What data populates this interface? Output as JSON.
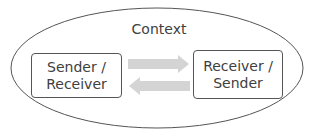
{
  "diagram": {
    "context_label": "Context",
    "left_box": {
      "line1": "Sender /",
      "line2": "Receiver"
    },
    "right_box": {
      "line1": "Receiver /",
      "line2": "Sender"
    },
    "arrows": [
      {
        "direction": "right",
        "from": "left_box",
        "to": "right_box"
      },
      {
        "direction": "left",
        "from": "right_box",
        "to": "left_box"
      }
    ],
    "colors": {
      "arrow": "#d4d4d4",
      "outline": "#555555",
      "text": "#404040"
    }
  }
}
